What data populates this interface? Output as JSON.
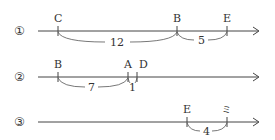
{
  "rows": [
    {
      "index_label": "①",
      "points": [
        {
          "name": "C",
          "x": 58
        },
        {
          "name": "B",
          "x": 177
        },
        {
          "name": "E",
          "x": 227
        }
      ],
      "spans": [
        {
          "label": "12",
          "from": 58,
          "to": 177
        },
        {
          "label": "5",
          "from": 177,
          "to": 227
        }
      ]
    },
    {
      "index_label": "②",
      "points": [
        {
          "name": "B",
          "x": 58
        },
        {
          "name": "A",
          "x": 128
        },
        {
          "name": "D",
          "x": 137
        }
      ],
      "spans": [
        {
          "label": "7",
          "from": 58,
          "to": 128
        },
        {
          "label": "1",
          "from": 128,
          "to": 137
        }
      ]
    },
    {
      "index_label": "③",
      "points": [
        {
          "name": "E",
          "x": 187
        },
        {
          "name": "ミ",
          "x": 227
        }
      ],
      "spans": [
        {
          "label": "4",
          "from": 187,
          "to": 227
        }
      ]
    }
  ]
}
